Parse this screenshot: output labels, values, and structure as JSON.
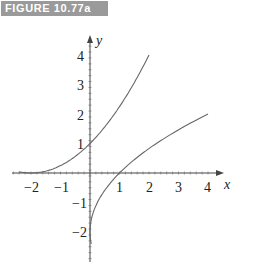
{
  "figure": {
    "label": "FIGURE 10.77a"
  },
  "chart_data": {
    "type": "line",
    "title": "",
    "xlabel": "x",
    "ylabel": "y",
    "xlim": [
      -2.5,
      4.3
    ],
    "ylim": [
      -2.5,
      4.6
    ],
    "xticks": [
      -2,
      -1,
      1,
      2,
      3,
      4
    ],
    "yticks": [
      -2,
      -1,
      1,
      2,
      3,
      4
    ],
    "xtick_labels": [
      "−2",
      "−1",
      "1",
      "2",
      "3",
      "4"
    ],
    "ytick_labels": [
      "−2",
      "−1",
      "1",
      "2",
      "3",
      "4"
    ],
    "grid": false,
    "legend": null,
    "series": [
      {
        "name": "f(x)",
        "description": "increasing convex curve through (-2,0), (0,1), (2,4)",
        "x": [
          -2.4,
          -2,
          -1,
          0,
          1,
          2
        ],
        "y": [
          0.04,
          0,
          0.25,
          1,
          2.25,
          4
        ]
      },
      {
        "name": "f^-1(x)",
        "description": "inverse curve through (0,-2), (1,0), (4,2)",
        "x": [
          -0.05,
          0,
          0.25,
          1,
          2,
          3,
          4
        ],
        "y": [
          -2.4,
          -2,
          -1,
          0,
          0.83,
          1.46,
          2
        ]
      }
    ],
    "colors": {
      "curve": "#666666",
      "axis": "#333333",
      "label_bg": "#9a9a9a"
    }
  }
}
